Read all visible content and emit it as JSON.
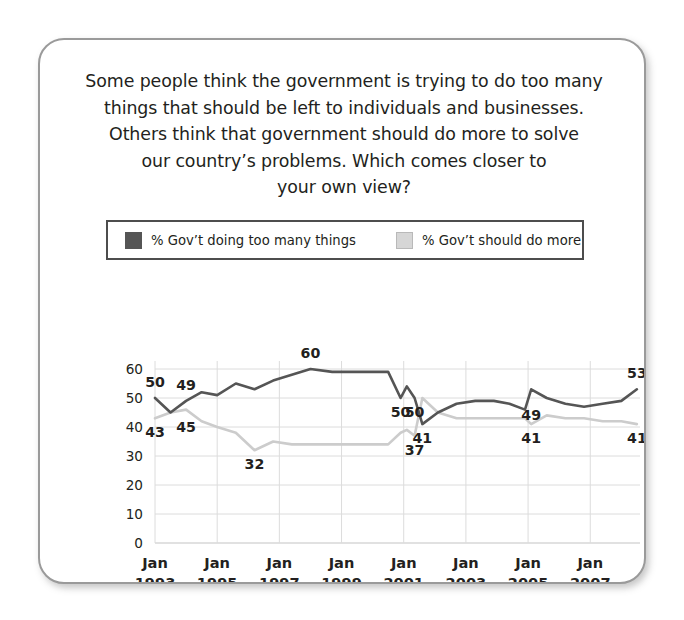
{
  "question": {
    "lines": [
      "Some people think the government is trying to do too many",
      "things that should be left to individuals and businesses.",
      "Others think that government should do more to solve",
      "our country’s problems. Which comes closer to",
      "your own view?"
    ]
  },
  "legend": {
    "entries": [
      {
        "label": "% Gov’t doing too many things",
        "color": "#555555",
        "swatch": "dark"
      },
      {
        "label": "% Gov’t should do more",
        "color": "#d6d6d6",
        "swatch": "light"
      }
    ]
  },
  "chart_data": {
    "type": "line",
    "xlabel": "",
    "ylabel": "",
    "ylim": [
      0,
      60
    ],
    "yticks": [
      0,
      10,
      20,
      30,
      40,
      50,
      60
    ],
    "ytick_labels": [
      "0",
      "10",
      "20",
      "30",
      "40",
      "50",
      "60"
    ],
    "grid": true,
    "legend_position": "above-plot",
    "xtick_labels": [
      {
        "month": "Jan",
        "year": "1993"
      },
      {
        "month": "Jan",
        "year": "1995"
      },
      {
        "month": "Jan",
        "year": "1997"
      },
      {
        "month": "Jan",
        "year": "1999"
      },
      {
        "month": "Jan",
        "year": "2001"
      },
      {
        "month": "Jan",
        "year": "2003"
      },
      {
        "month": "Jan",
        "year": "2005"
      },
      {
        "month": "Jan",
        "year": "2007"
      }
    ],
    "xlim": [
      1993.0,
      2008.6
    ],
    "series": [
      {
        "name": "% Gov’t doing too many things",
        "color": "#555555",
        "x": [
          1993.0,
          1993.5,
          1994.0,
          1994.5,
          1995.0,
          1995.6,
          1996.2,
          1996.8,
          1997.4,
          1998.0,
          1998.7,
          1999.4,
          2000.0,
          2000.5,
          2000.9,
          2001.1,
          2001.35,
          2001.6,
          2002.1,
          2002.7,
          2003.3,
          2003.9,
          2004.4,
          2004.9,
          2005.1,
          2005.6,
          2006.2,
          2006.8,
          2007.4,
          2008.0,
          2008.5
        ],
        "y": [
          50,
          45,
          49,
          52,
          51,
          55,
          53,
          56,
          58,
          60,
          59,
          59,
          59,
          59,
          50,
          54,
          50,
          41,
          45,
          48,
          49,
          49,
          48,
          46,
          53,
          50,
          48,
          47,
          48,
          49,
          53
        ]
      },
      {
        "name": "% Gov’t should do more",
        "color": "#cccccc",
        "x": [
          1993.0,
          1993.5,
          1994.0,
          1994.5,
          1995.0,
          1995.6,
          1996.2,
          1996.8,
          1997.4,
          1998.0,
          1998.7,
          1999.4,
          2000.0,
          2000.5,
          2000.9,
          2001.1,
          2001.35,
          2001.6,
          2002.1,
          2002.7,
          2003.3,
          2003.9,
          2004.4,
          2004.9,
          2005.1,
          2005.6,
          2006.2,
          2006.8,
          2007.4,
          2008.0,
          2008.5
        ],
        "y": [
          43,
          45,
          46,
          42,
          40,
          38,
          32,
          35,
          34,
          34,
          34,
          34,
          34,
          34,
          38,
          39,
          37,
          50,
          45,
          43,
          43,
          43,
          43,
          43,
          41,
          44,
          43,
          43,
          42,
          42,
          41
        ]
      }
    ],
    "data_labels": [
      {
        "text": "50",
        "x": 1993.0,
        "y": 50,
        "series": "dark",
        "pos": "above"
      },
      {
        "text": "49",
        "x": 1994.0,
        "y": 49,
        "series": "dark",
        "pos": "above"
      },
      {
        "text": "43",
        "x": 1993.0,
        "y": 43,
        "series": "light",
        "pos": "below"
      },
      {
        "text": "45",
        "x": 1994.0,
        "y": 45,
        "series": "light",
        "pos": "below"
      },
      {
        "text": "60",
        "x": 1998.0,
        "y": 60,
        "series": "dark",
        "pos": "above"
      },
      {
        "text": "32",
        "x": 1996.2,
        "y": 32,
        "series": "light",
        "pos": "below"
      },
      {
        "text": "50",
        "x": 2000.9,
        "y": 50,
        "series": "dark",
        "pos": "below"
      },
      {
        "text": "37",
        "x": 2001.35,
        "y": 37,
        "series": "light",
        "pos": "below"
      },
      {
        "text": "50",
        "x": 2001.35,
        "y": 50,
        "series": "dark",
        "pos": "below"
      },
      {
        "text": "41",
        "x": 2001.6,
        "y": 41,
        "series": "dark",
        "pos": "below"
      },
      {
        "text": "49",
        "x": 2005.1,
        "y": 49,
        "series": "dark",
        "pos": "below"
      },
      {
        "text": "41",
        "x": 2005.1,
        "y": 41,
        "series": "light",
        "pos": "below"
      },
      {
        "text": "53",
        "x": 2008.5,
        "y": 53,
        "series": "dark",
        "pos": "above"
      },
      {
        "text": "41",
        "x": 2008.5,
        "y": 41,
        "series": "light",
        "pos": "below"
      }
    ]
  }
}
